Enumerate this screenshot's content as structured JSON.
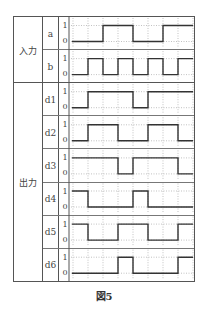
{
  "figure": {
    "caption": "図5",
    "groups": [
      {
        "label": "入力",
        "signals": [
          "a",
          "b"
        ]
      },
      {
        "label": "出力",
        "signals": [
          "d1",
          "d2",
          "d3",
          "d4",
          "d5",
          "d6"
        ]
      }
    ],
    "level_labels": {
      "high": "1",
      "low": "0"
    },
    "time_slots": 8,
    "signals": [
      {
        "name": "a",
        "values": [
          0,
          0,
          1,
          1,
          0,
          0,
          1,
          1
        ]
      },
      {
        "name": "b",
        "values": [
          0,
          1,
          0,
          1,
          0,
          1,
          0,
          1
        ]
      },
      {
        "name": "d1",
        "values": [
          0,
          1,
          1,
          1,
          0,
          1,
          1,
          1
        ]
      },
      {
        "name": "d2",
        "values": [
          0,
          1,
          1,
          0,
          0,
          1,
          1,
          0
        ]
      },
      {
        "name": "d3",
        "values": [
          1,
          1,
          1,
          0,
          1,
          1,
          1,
          0
        ]
      },
      {
        "name": "d4",
        "values": [
          1,
          0,
          0,
          0,
          1,
          0,
          0,
          0
        ]
      },
      {
        "name": "d5",
        "values": [
          1,
          0,
          0,
          1,
          1,
          0,
          0,
          1
        ]
      },
      {
        "name": "d6",
        "values": [
          0,
          0,
          0,
          1,
          0,
          0,
          0,
          1
        ]
      }
    ],
    "colors": {
      "line": "#333333",
      "grid": "#999999",
      "border": "#555555"
    }
  }
}
